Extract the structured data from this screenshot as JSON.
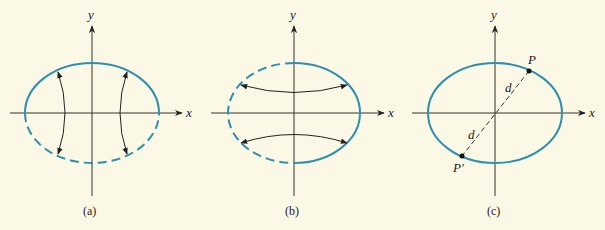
{
  "figure": {
    "background": "#fbf8e6",
    "ellipse_color": "#2e8fae",
    "axis_color": "#333333",
    "panels": [
      {
        "id": "a",
        "caption": "(a)",
        "x_label": "x",
        "y_label": "y",
        "description": "Ellipse; upper half solid, lower half dashed; vertical curved double arrows reflecting across x-axis"
      },
      {
        "id": "b",
        "caption": "(b)",
        "x_label": "x",
        "y_label": "y",
        "description": "Ellipse; right half solid, left half dashed; horizontal curved double arrows reflecting across y-axis"
      },
      {
        "id": "c",
        "caption": "(c)",
        "x_label": "x",
        "y_label": "y",
        "point_label": "P",
        "point_prime_label": "P′",
        "distance_label_upper": "d",
        "distance_label_lower": "d",
        "description": "Full solid ellipse; dashed segment through origin from P to P′ showing symmetry about origin"
      }
    ]
  }
}
